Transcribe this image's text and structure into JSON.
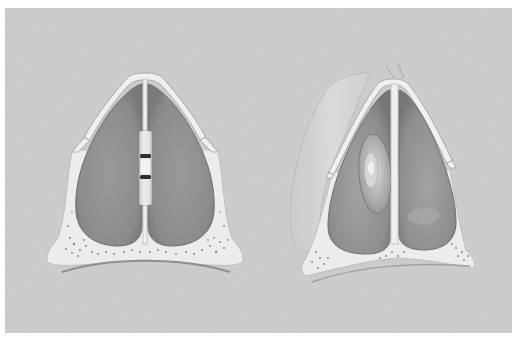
{
  "figure": {
    "type": "medical-illustration",
    "style": "grayscale airbrushed drawing",
    "colors": {
      "page_background": "#ffffff",
      "panel_background": "#c9c9c9",
      "bone_cartilage": "#ebebeb",
      "bone_outline": "#9a9a9a",
      "cavity_fill": "#8f8f8f",
      "cavity_edge": "#6e6e6e",
      "splint": "#dcdcdc",
      "splint_gap": "#2e2e2e",
      "polyp": "#b5b5b5",
      "soft_tissue": "#d6d6d6"
    },
    "panels": [
      {
        "id": "left",
        "description": "Nasal cavity with a septal splint clipped to the midline septum",
        "features": [
          "nasal-septum",
          "septal-splint",
          "left-nasal-cavity",
          "right-nasal-cavity",
          "maxillary-bone-base"
        ]
      },
      {
        "id": "right",
        "description": "Nasal cavity with an oval mass / polyp in the left passage and soft-tissue outline of the external nose",
        "features": [
          "nasal-septum",
          "nasal-polyp",
          "left-nasal-cavity",
          "right-nasal-cavity",
          "external-nose-silhouette",
          "maxillary-bone-base"
        ]
      }
    ]
  }
}
